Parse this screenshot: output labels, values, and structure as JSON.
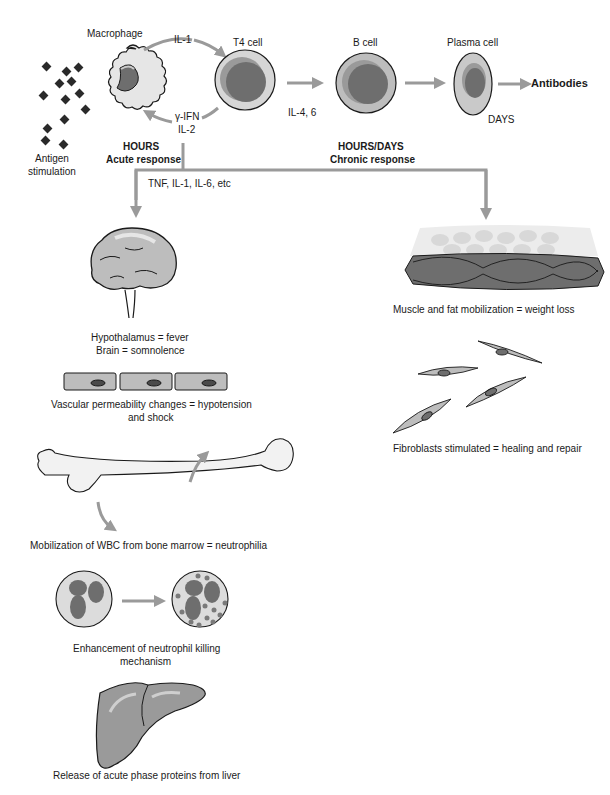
{
  "cells": {
    "macrophage": "Macrophage",
    "t4": "T4 cell",
    "bcell": "B cell",
    "plasma": "Plasma cell",
    "antibodies": "Antibodies"
  },
  "antigen": {
    "line1": "Antigen",
    "line2": "stimulation"
  },
  "signals": {
    "il1": "IL-1",
    "gifn": "γ-IFN",
    "il2": "IL-2",
    "il46": "IL-4, 6",
    "days": "DAYS",
    "tnf": "TNF, IL-1, IL-6, etc"
  },
  "acute": {
    "time": "HOURS",
    "label": "Acute response"
  },
  "chronic": {
    "time": "HOURS/DAYS",
    "label": "Chronic response"
  },
  "effects": {
    "brain1": "Hypothalamus = fever",
    "brain2": "Brain = somnolence",
    "vasc1": "Vascular permeability changes = hypotension",
    "vasc2": "and shock",
    "bone": "Mobilization of WBC from bone marrow = neutrophilia",
    "neut1": "Enhancement of neutrophil killing",
    "neut2": "mechanism",
    "liver": "Release of acute phase proteins from liver",
    "muscle": "Muscle and fat mobilization = weight loss",
    "fibro": "Fibroblasts stimulated = healing and repair"
  },
  "colors": {
    "arrow": "#9a9a9a",
    "cell_fill": "#bdbdbd",
    "nucleus": "#6e6e6e",
    "outline": "#1a1a1a"
  }
}
